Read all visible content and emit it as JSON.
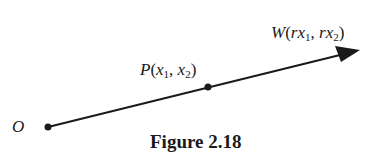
{
  "figure": {
    "caption": "Figure 2.18",
    "points": {
      "origin": {
        "name": "O"
      },
      "p": {
        "name": "P",
        "open": "(",
        "c1": "x",
        "s1": "1",
        "sep": ", ",
        "c2": "x",
        "s2": "2",
        "close": ")"
      },
      "w": {
        "name": "W",
        "open": "(",
        "c1": "rx",
        "s1": "1",
        "sep": ", ",
        "c2": "rx",
        "s2": "2",
        "close": ")"
      }
    },
    "vector": {
      "from": "O",
      "through": "P",
      "to": "W",
      "description": "Vector from origin O through P(x1, x2) extending to W(rx1, rx2)"
    },
    "colors": {
      "ink": "#1a1a1a",
      "background": "#ffffff"
    }
  }
}
